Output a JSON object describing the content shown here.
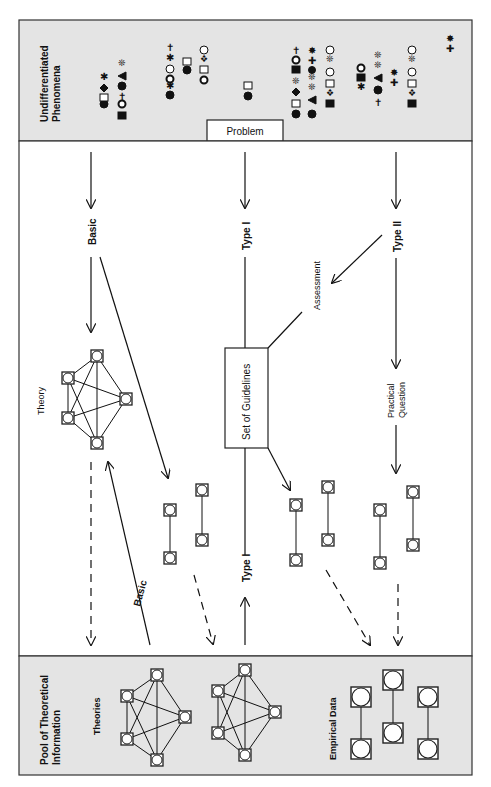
{
  "panels": {
    "top": {
      "label_line1": "Undifferentiated",
      "label_line2": "Phenomena",
      "problem_label": "Problem"
    },
    "bottom": {
      "label_line1": "Pool of Theoretical",
      "label_line2": "Information",
      "theories_label": "Theories",
      "empirical_label": "Empirical Data"
    }
  },
  "flow": {
    "basic_label": "Basic",
    "type1_label": "Type I",
    "type2_label": "Type II",
    "assessment_label": "Assessment",
    "theory_label": "Theory",
    "guidelines_label": "Set of Guidelines",
    "practical_line1": "Practical",
    "practical_line2": "Question",
    "basic_return_label": "Basic",
    "type1_return_label": "Type I"
  },
  "colors": {
    "panel_bg": "#e4e4e4",
    "line": "#111111",
    "border": "#333333"
  }
}
